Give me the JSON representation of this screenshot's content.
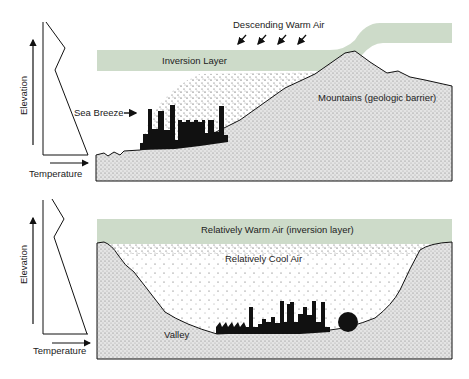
{
  "colors": {
    "inversion": "#cddbc9",
    "ground": "#d9d9d9",
    "ink": "#111111",
    "background": "#ffffff"
  },
  "top_panel": {
    "descending_warm_air": "Descending Warm Air",
    "inversion_layer": "Inversion Layer",
    "sea_breeze": "Sea Breeze",
    "mountains": "Mountains (geologic barrier)",
    "profile": {
      "y_axis_label": "Elevation",
      "x_axis_label": "Temperature"
    }
  },
  "bottom_panel": {
    "warm_air": "Relatively Warm Air (inversion layer)",
    "cool_air": "Relatively Cool Air",
    "valley": "Valley",
    "profile": {
      "y_axis_label": "Elevation",
      "x_axis_label": "Temperature"
    }
  }
}
